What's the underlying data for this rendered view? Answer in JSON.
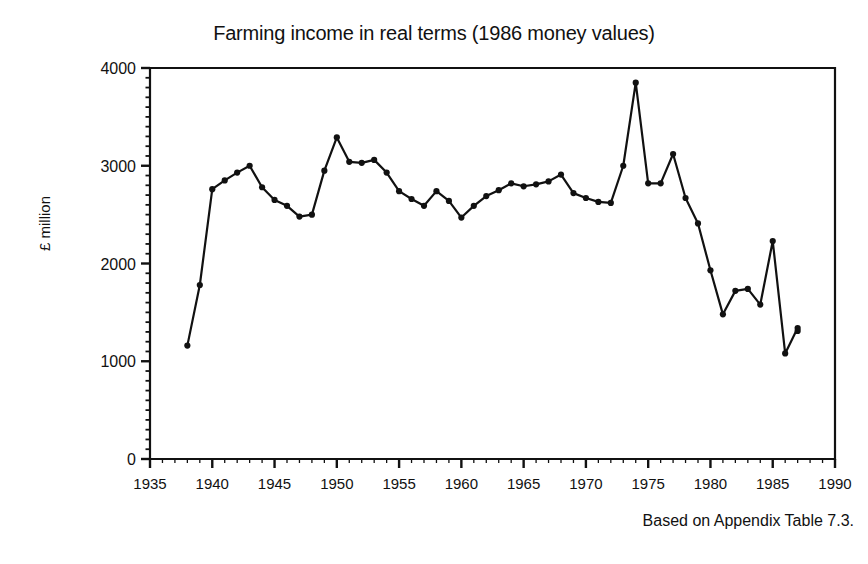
{
  "chart_data": {
    "type": "line",
    "title": "Farming income in real terms (1986 money values)",
    "xlabel": "",
    "ylabel": "£ million",
    "footnote": "Based on Appendix Table 7.3.",
    "xlim": [
      1935,
      1990
    ],
    "ylim": [
      0,
      4000
    ],
    "xticks": [
      1935,
      1940,
      1945,
      1950,
      1955,
      1960,
      1965,
      1970,
      1975,
      1980,
      1985,
      1990
    ],
    "yticks": [
      0,
      1000,
      2000,
      3000,
      4000
    ],
    "x_minor_tick_interval": 1,
    "y_minor_tick_interval": 100,
    "grid": false,
    "legend": false,
    "marker": "filled-circle",
    "line_color": "#111111",
    "series": [
      {
        "name": "Farming income (real terms, 1986 prices)",
        "x": [
          1938,
          1939,
          1940,
          1941,
          1942,
          1943,
          1944,
          1945,
          1946,
          1947,
          1948,
          1949,
          1950,
          1951,
          1952,
          1953,
          1954,
          1955,
          1956,
          1957,
          1958,
          1959,
          1960,
          1961,
          1962,
          1963,
          1964,
          1965,
          1966,
          1967,
          1968,
          1969,
          1970,
          1971,
          1972,
          1973,
          1974,
          1975,
          1976,
          1977,
          1978,
          1979,
          1980,
          1981,
          1982,
          1983,
          1984,
          1985,
          1986,
          1987
        ],
        "values": [
          1160,
          1780,
          2760,
          2850,
          2930,
          3000,
          2780,
          2650,
          2590,
          2480,
          2500,
          2950,
          3290,
          3040,
          3030,
          3060,
          2930,
          2740,
          2660,
          2590,
          2740,
          2640,
          2470,
          2590,
          2690,
          2750,
          2820,
          2790,
          2810,
          2840,
          2910,
          2720,
          2670,
          2630,
          2620,
          3000,
          3850,
          2820,
          2820,
          3120,
          2670,
          2410,
          1930,
          1480,
          1720,
          1740,
          1580,
          2230,
          1080,
          1340
        ],
        "note_max": {
          "year": 1973,
          "value": 3850
        },
        "note_min": {
          "year": 1938,
          "value": 1160
        }
      }
    ],
    "extra_point": {
      "x": 1987,
      "y": 1310
    }
  },
  "axis": {
    "y_tick_labels": [
      "0",
      "1000",
      "2000",
      "3000",
      "4000"
    ],
    "x_tick_labels": [
      "1935",
      "1940",
      "1945",
      "1950",
      "1955",
      "1960",
      "1965",
      "1970",
      "1975",
      "1980",
      "1985",
      "1990"
    ]
  }
}
